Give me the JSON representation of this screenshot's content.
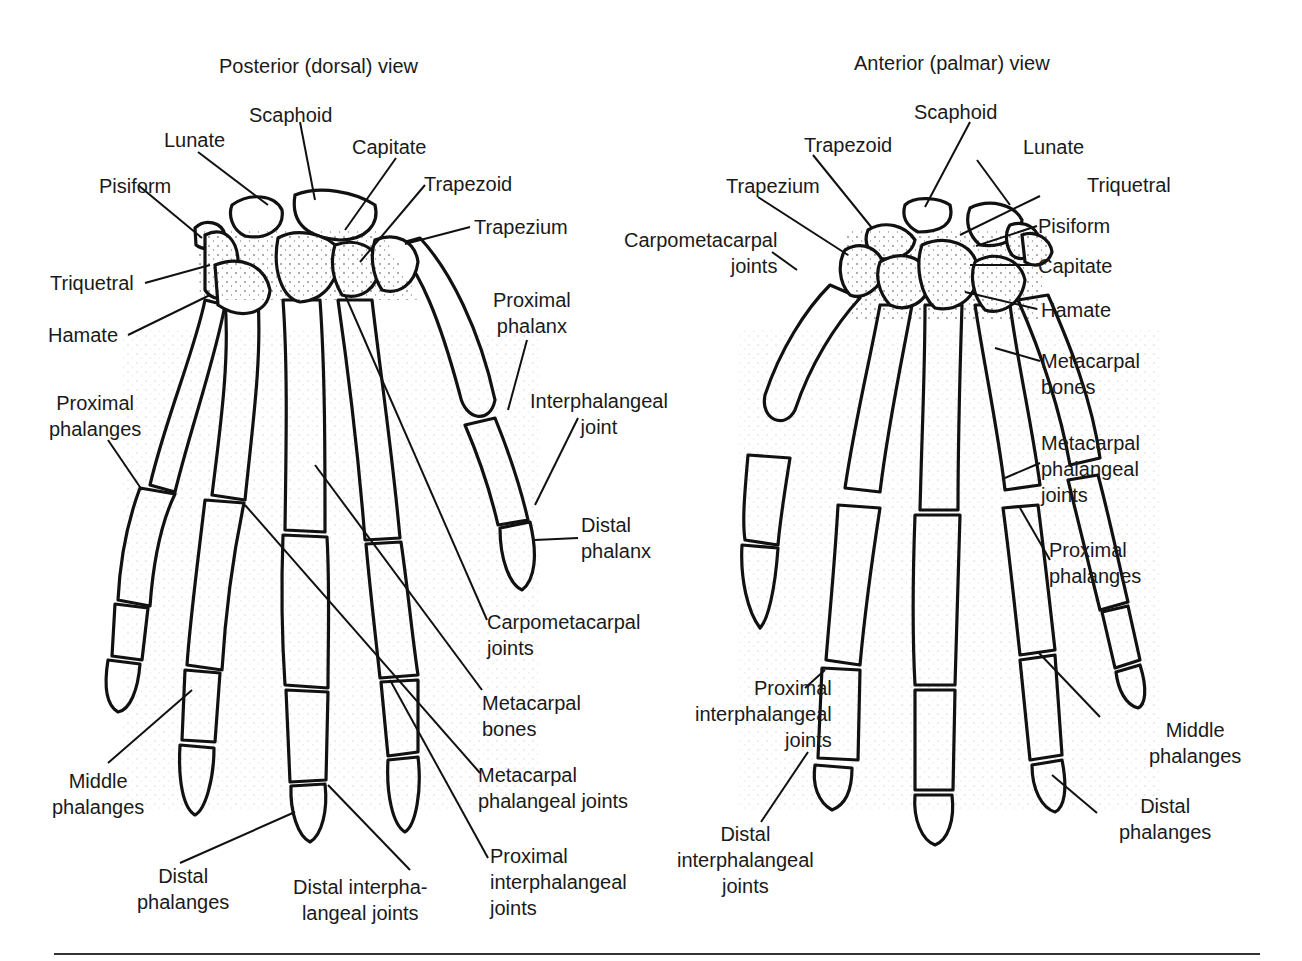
{
  "figure": {
    "views": [
      {
        "id": "posterior",
        "title": "Posterior (dorsal) view",
        "labels": [
          {
            "key": "scaphoid",
            "text": "Scaphoid"
          },
          {
            "key": "lunate",
            "text": "Lunate"
          },
          {
            "key": "capitate",
            "text": "Capitate"
          },
          {
            "key": "pisiform",
            "text": "Pisiform"
          },
          {
            "key": "trapezoid",
            "text": "Trapezoid"
          },
          {
            "key": "trapezium",
            "text": "Trapezium"
          },
          {
            "key": "triquetral",
            "text": "Triquetral"
          },
          {
            "key": "hamate",
            "text": "Hamate"
          },
          {
            "key": "proximal_phalanx",
            "text": "Proximal\nphalanx"
          },
          {
            "key": "proximal_phalanges",
            "text": "Proximal\nphalanges"
          },
          {
            "key": "interphalangeal_joint",
            "text": "Interphalangeal\njoint"
          },
          {
            "key": "distal_phalanx",
            "text": "Distal\nphalanx"
          },
          {
            "key": "carpometacarpal_joints",
            "text": "Carpometacarpal\njoints"
          },
          {
            "key": "metacarpal_bones",
            "text": "Metacarpal\nbones"
          },
          {
            "key": "middle_phalanges",
            "text": "Middle\nphalanges"
          },
          {
            "key": "metacarpal_phalangeal_joints",
            "text": "Metacarpal\nphalangeal joints"
          },
          {
            "key": "distal_phalanges",
            "text": "Distal\nphalanges"
          },
          {
            "key": "distal_interphalangeal_joints",
            "text": "Distal interpha-\nlangeal joints"
          },
          {
            "key": "proximal_interphalangeal_joints",
            "text": "Proximal\ninterphalangeal\njoints"
          }
        ]
      },
      {
        "id": "anterior",
        "title": "Anterior (palmar) view",
        "labels": [
          {
            "key": "scaphoid",
            "text": "Scaphoid"
          },
          {
            "key": "trapezoid",
            "text": "Trapezoid"
          },
          {
            "key": "lunate",
            "text": "Lunate"
          },
          {
            "key": "trapezium",
            "text": "Trapezium"
          },
          {
            "key": "triquetral",
            "text": "Triquetral"
          },
          {
            "key": "pisiform",
            "text": "Pisiform"
          },
          {
            "key": "carpometacarpal_joints",
            "text": "Carpometacarpal\njoints"
          },
          {
            "key": "capitate",
            "text": "Capitate"
          },
          {
            "key": "hamate",
            "text": "Hamate"
          },
          {
            "key": "metacarpal_bones",
            "text": "Metacarpal\nbones"
          },
          {
            "key": "metacarpal_phalangeal_joints",
            "text": "Metacarpal\nphalangeal\njoints"
          },
          {
            "key": "proximal_phalanges",
            "text": "Proximal\nphalanges"
          },
          {
            "key": "proximal_interphalangeal_joints",
            "text": "Proximal\ninterphalangeal\njoints"
          },
          {
            "key": "middle_phalanges",
            "text": "Middle\nphalanges"
          },
          {
            "key": "distal_phalanges",
            "text": "Distal\nphalanges"
          },
          {
            "key": "distal_interphalangeal_joints",
            "text": "Distal\ninterphalangeal\njoints"
          }
        ]
      }
    ],
    "colors": {
      "line": "#111111",
      "background": "#ffffff",
      "rule": "#333333"
    }
  }
}
